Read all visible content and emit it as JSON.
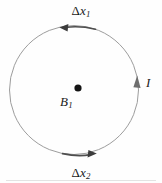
{
  "figure": {
    "type": "physics-diagram",
    "background_color": "#fefefe",
    "loop": {
      "name": "current-loop",
      "shape": "circle",
      "center_x": 74,
      "center_y": 90,
      "radius": 65,
      "stroke_color": "#9a9a9a",
      "stroke_width": 1
    },
    "center_point": {
      "name": "field-point",
      "x": 78,
      "y": 88,
      "radius": 3.4,
      "color": "#141414"
    },
    "labels": {
      "delta_x1": {
        "delta": "Δ",
        "variable": "x",
        "subscript": "1",
        "x": 78,
        "y": 10
      },
      "delta_x2": {
        "delta": "Δ",
        "variable": "x",
        "subscript": "2",
        "x": 78,
        "y": 172
      },
      "field": {
        "variable": "B",
        "subscript": "1",
        "x": 66,
        "y": 101
      },
      "current": {
        "variable": "I",
        "x": 150,
        "y": 82
      }
    },
    "arrows": [
      {
        "name": "delta-x1-arrow",
        "position": "top-arc",
        "direction": "left",
        "tip_x": 60,
        "tip_y": 27,
        "tail_x": 96,
        "tail_y": 28,
        "color": "#4a4a4a"
      },
      {
        "name": "delta-x2-arrow",
        "position": "bottom-arc",
        "direction": "right",
        "tip_x": 96,
        "tip_y": 155,
        "tail_x": 62,
        "tail_y": 156,
        "color": "#4a4a4a"
      },
      {
        "name": "current-direction-arrow",
        "position": "right-arc",
        "direction": "up",
        "tip_x": 137,
        "tip_y": 76,
        "color": "#6a6a6a"
      }
    ]
  }
}
